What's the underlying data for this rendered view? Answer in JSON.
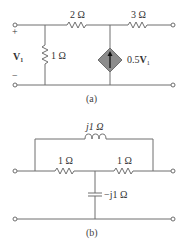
{
  "figure_a": {
    "caption": "(a)",
    "resistor_series_1": "2 Ω",
    "resistor_series_2": "3 Ω",
    "resistor_shunt": "1 Ω",
    "source_label_main": "0.5",
    "source_label_var": "V",
    "source_label_sub": "1",
    "input_voltage_main": "V",
    "input_voltage_sub": "1",
    "plus_sign": "+",
    "minus_sign": "−",
    "source_color": "#8c8c8c"
  },
  "figure_b": {
    "caption": "(b)",
    "inductor_label": "j1 Ω",
    "resistor_left": "1 Ω",
    "resistor_right": "1 Ω",
    "capacitor_label": "−j1 Ω"
  }
}
